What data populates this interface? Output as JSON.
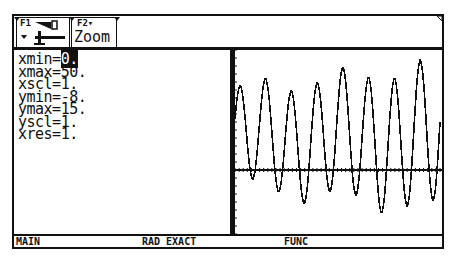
{
  "toolbar": {
    "f1": {
      "key": "F1",
      "icon": "tools-icon"
    },
    "f2": {
      "key": "F2▾",
      "label": "Zoom"
    }
  },
  "window_vars": {
    "lines": [
      {
        "name": "xmin",
        "value": "0."
      },
      {
        "name": "xmax",
        "value": "50."
      },
      {
        "name": "xscl",
        "value": "1."
      },
      {
        "name": "ymin",
        "value": "-8."
      },
      {
        "name": "ymax",
        "value": "15."
      },
      {
        "name": "yscl",
        "value": "1."
      },
      {
        "name": "xres",
        "value": "1."
      }
    ],
    "line_text": [
      "xmin=",
      "xmax=50.",
      "xscl=1.",
      "ymin=-8.",
      "ymax=15.",
      "yscl=1.",
      "xres=1."
    ],
    "cursor_value": "0."
  },
  "graph": {
    "xmin": 0,
    "xmax": 50,
    "ymin": -8,
    "ymax": 15,
    "description": "oscillating sinusoid with slightly growing amplitude, ~8 cycles",
    "color": "#111111"
  },
  "status": {
    "mode": "MAIN",
    "angle": "RAD EXACT",
    "graph_mode": "FUNC"
  }
}
